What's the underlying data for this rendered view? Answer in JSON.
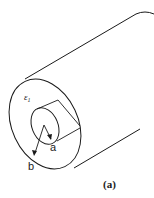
{
  "figure": {
    "caption": "(a)",
    "labels": {
      "dielectric": "ε",
      "dielectric_subscript": "1",
      "inner_radius": "a",
      "outer_radius": "b"
    },
    "colors": {
      "stroke": "#1a1a1a",
      "background": "#ffffff"
    }
  }
}
